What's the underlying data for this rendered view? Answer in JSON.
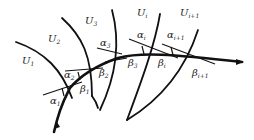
{
  "diagram": {
    "regions": [
      {
        "id": "U1",
        "base": "U",
        "sub": "1",
        "x": 22,
        "y": 64
      },
      {
        "id": "U2",
        "base": "U",
        "sub": "2",
        "x": 48,
        "y": 42
      },
      {
        "id": "U3",
        "base": "U",
        "sub": "3",
        "x": 85,
        "y": 24
      },
      {
        "id": "Ui",
        "base": "U",
        "sub": "i",
        "x": 137,
        "y": 16
      },
      {
        "id": "Ui+1",
        "base": "U",
        "sub": "i+1",
        "x": 180,
        "y": 16
      }
    ],
    "alpha_labels": [
      {
        "base": "α",
        "sub": "1",
        "x": 50,
        "y": 104
      },
      {
        "base": "α",
        "sub": "2",
        "x": 64,
        "y": 76
      },
      {
        "base": "α",
        "sub": "3",
        "x": 100,
        "y": 47
      },
      {
        "base": "α",
        "sub": "i",
        "x": 137,
        "y": 39
      },
      {
        "base": "α",
        "sub": "i+1",
        "x": 167,
        "y": 39
      }
    ],
    "beta_labels": [
      {
        "base": "β",
        "sub": "1",
        "x": 80,
        "y": 91
      },
      {
        "base": "β",
        "sub": "2",
        "x": 99,
        "y": 74
      },
      {
        "base": "β",
        "sub": "3",
        "x": 128,
        "y": 66
      },
      {
        "base": "β",
        "sub": "i",
        "x": 158,
        "y": 66
      },
      {
        "base": "β",
        "sub": "i+1",
        "x": 192,
        "y": 75
      }
    ]
  }
}
